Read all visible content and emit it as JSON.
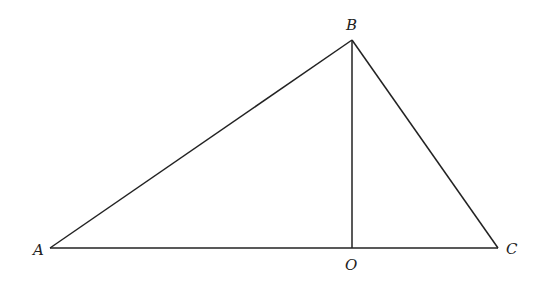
{
  "diagram": {
    "type": "triangle-with-altitude",
    "points": {
      "A": {
        "label": "A",
        "x": 50,
        "y": 248
      },
      "B": {
        "label": "B",
        "x": 352,
        "y": 40
      },
      "C": {
        "label": "C",
        "x": 498,
        "y": 248
      },
      "O": {
        "label": "O",
        "x": 352,
        "y": 248
      }
    },
    "segments": [
      "AB",
      "BC",
      "AC",
      "BO"
    ],
    "line_color": "#222222"
  }
}
